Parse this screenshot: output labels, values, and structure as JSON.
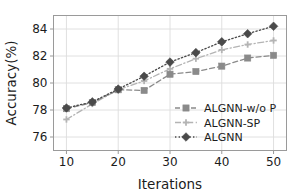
{
  "chart_data": {
    "type": "line",
    "title": "",
    "xlabel": "Iterations",
    "ylabel": "Accuracy(%)",
    "x": [
      10,
      15,
      20,
      25,
      30,
      35,
      40,
      45,
      50
    ],
    "xlim": [
      7.5,
      52.5
    ],
    "ylim": [
      75.0,
      85.0
    ],
    "xticks": [
      10,
      20,
      30,
      40,
      50
    ],
    "xticklabels": [
      "10",
      "20",
      "30",
      "40",
      "50"
    ],
    "yticks": [
      76,
      78,
      80,
      82,
      84
    ],
    "yticklabels": [
      "76",
      "78",
      "80",
      "82",
      "84"
    ],
    "grid": true,
    "legend_position": "lower right",
    "series": [
      {
        "name": "ALGNN-w/o P",
        "values": [
          78.1,
          78.55,
          79.5,
          79.45,
          80.65,
          80.85,
          81.25,
          81.85,
          82.05
        ],
        "marker": "square",
        "linestyle": "dashed",
        "color": "#8a8a8a"
      },
      {
        "name": "ALGNN-SP",
        "values": [
          77.3,
          78.45,
          79.5,
          80.15,
          81.05,
          81.8,
          82.45,
          82.85,
          83.15
        ],
        "marker": "plus",
        "linestyle": "dashdot",
        "color": "#b4b4b4"
      },
      {
        "name": "ALGNN",
        "values": [
          78.15,
          78.6,
          79.55,
          80.5,
          81.55,
          82.25,
          83.05,
          83.65,
          84.2
        ],
        "marker": "diamond",
        "linestyle": "dotted",
        "color": "#4a4a4a"
      }
    ]
  },
  "legend": {
    "items": [
      {
        "label": "ALGNN-w/o P"
      },
      {
        "label": "ALGNN-SP"
      },
      {
        "label": "ALGNN"
      }
    ]
  },
  "colors": {
    "axis": "#9a9a9a",
    "grid": "#dcdcdc",
    "text": "#1c1c1c",
    "background": "#ffffff"
  }
}
